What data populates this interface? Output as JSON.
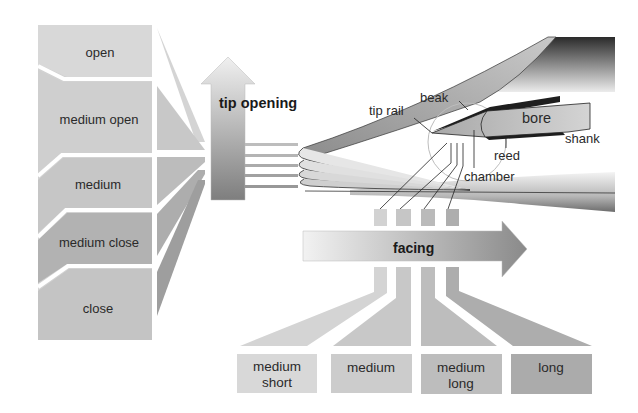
{
  "diagram": {
    "tip_opening": {
      "arrow_label": "tip opening",
      "levels": [
        {
          "label": "open",
          "color": "#d6d6d6"
        },
        {
          "label": "medium open",
          "color": "#d0d0d0"
        },
        {
          "label": "medium",
          "color": "#c8c8c8"
        },
        {
          "label": "medium close",
          "color": "#b4b4b4"
        },
        {
          "label": "close",
          "color": "#c4c4c4"
        }
      ]
    },
    "facing": {
      "arrow_label": "facing",
      "levels": [
        {
          "line1": "medium",
          "line2": "short",
          "color": "#d8d8d8"
        },
        {
          "line1": "medium",
          "line2": "",
          "color": "#cccccc"
        },
        {
          "line1": "medium",
          "line2": "long",
          "color": "#bcbcbc"
        },
        {
          "line1": "long",
          "line2": "",
          "color": "#ababab"
        }
      ]
    },
    "mouthpiece_parts": {
      "beak": "beak",
      "tip_rail": "tip rail",
      "bore": "bore",
      "shank": "shank",
      "reed": "reed",
      "chamber": "chamber"
    },
    "colors": {
      "arrow_light": "#eeeeee",
      "arrow_dark": "#8a8a8a",
      "mouthpiece_dark": "#2e2e2e",
      "line": "#222222"
    }
  }
}
